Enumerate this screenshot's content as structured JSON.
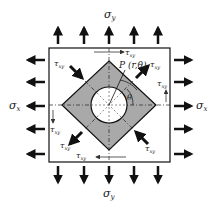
{
  "diagram": {
    "labels": {
      "sigma_y_top": "σ",
      "sigma_y_top_sub": "y",
      "sigma_y_bottom": "σ",
      "sigma_y_bottom_sub": "y",
      "sigma_x_left": "σ",
      "sigma_x_left_sub": "x",
      "sigma_x_right": "σ",
      "sigma_x_right_sub": "x",
      "tau": "τ",
      "tau_sub": "xy",
      "point": "P (r,θ)",
      "angle": "θ"
    },
    "colors": {
      "stroke": "#111111",
      "diamond_fill": "#a9a9a9",
      "hole_fill": "#ffffff",
      "background": "#ffffff"
    }
  }
}
